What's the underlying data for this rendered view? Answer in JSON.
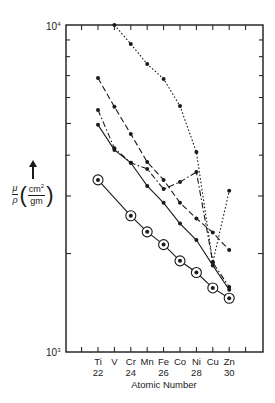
{
  "chart_data": {
    "type": "line",
    "title": "",
    "xlabel": "Atomic Number",
    "ylabel": "μ/ρ (cm²/gm)",
    "yscale": "log",
    "ylim": [
      1000,
      10000
    ],
    "xlim": [
      20,
      32
    ],
    "y_tick_labels": [
      "10³",
      "10⁴"
    ],
    "x_ticks": [
      21,
      22,
      23,
      24,
      25,
      26,
      27,
      28,
      29,
      30,
      31
    ],
    "x_element_labels": [
      {
        "x": 22,
        "symbol": "Ti",
        "number": "22"
      },
      {
        "x": 23,
        "symbol": "V",
        "number": ""
      },
      {
        "x": 24,
        "symbol": "Cr",
        "number": "24"
      },
      {
        "x": 25,
        "symbol": "Mn",
        "number": ""
      },
      {
        "x": 26,
        "symbol": "Fe",
        "number": "26"
      },
      {
        "x": 27,
        "symbol": "Co",
        "number": ""
      },
      {
        "x": 28,
        "symbol": "Ni",
        "number": "28"
      },
      {
        "x": 29,
        "symbol": "Cu",
        "number": ""
      },
      {
        "x": 30,
        "symbol": "Zn",
        "number": "30"
      }
    ],
    "grid": false,
    "legend": "none",
    "series": [
      {
        "name": "series-dotted",
        "line_style": "dotted",
        "marker": "dot",
        "x": [
          23,
          24,
          25,
          26,
          27,
          28,
          29,
          30
        ],
        "values": [
          10000,
          8750,
          7600,
          6840,
          5650,
          4090,
          1880,
          3110
        ]
      },
      {
        "name": "series-long-dash",
        "line_style": "long-dash",
        "marker": "dot",
        "x": [
          22,
          23,
          24,
          25,
          26,
          27,
          28,
          29,
          30
        ],
        "values": [
          6880,
          5620,
          4640,
          3810,
          3360,
          2860,
          2560,
          2320,
          2050
        ]
      },
      {
        "name": "series-dash-dot",
        "line_style": "dash-dot",
        "marker": "dot",
        "x": [
          22,
          23,
          24,
          25,
          26,
          27,
          28,
          29,
          30
        ],
        "values": [
          5500,
          4200,
          3790,
          3630,
          3150,
          3310,
          3550,
          1880,
          1580
        ]
      },
      {
        "name": "series-solid",
        "line_style": "solid",
        "marker": "dot",
        "x": [
          22,
          23,
          24,
          25,
          26,
          27,
          28,
          29,
          30
        ],
        "values": [
          4950,
          4150,
          3790,
          3220,
          2860,
          2470,
          2200,
          1840,
          1550
        ]
      },
      {
        "name": "series-circled",
        "line_style": "solid",
        "marker": "circled-dot",
        "x": [
          22,
          24,
          25,
          26,
          27,
          28,
          29,
          30
        ],
        "values": [
          3360,
          2610,
          2330,
          2130,
          1900,
          1750,
          1570,
          1460
        ]
      }
    ]
  },
  "labels": {
    "y_top": "10",
    "y_top_exp": "4",
    "y_bottom": "10",
    "y_bottom_exp": "3",
    "xlabel": "Atomic Number",
    "ylabel_num": "μ",
    "ylabel_den": "ρ",
    "unit_num": "cm",
    "unit_num_exp": "2",
    "unit_den": "gm"
  }
}
